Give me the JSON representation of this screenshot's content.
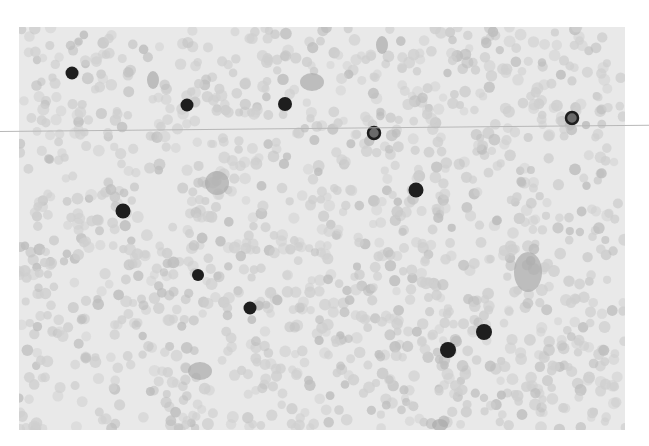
{
  "image": {
    "description": "Grayscale micrograph of a blood smear: dense field of pale red blood cells with scattered dark-stained nucleated cells",
    "colors": {
      "background": "#ffffff",
      "field": "#e9e9e9",
      "rbc": "#cfcfcf",
      "rbc_dark": "#bdbdbd",
      "nucleus": "#1e1e1e",
      "scanline": "#b8b8b8"
    },
    "frame": {
      "x": 19,
      "y": 27,
      "width": 606,
      "height": 403
    },
    "dark_cells": [
      {
        "x": 72,
        "y": 73,
        "r": 6.5
      },
      {
        "x": 187,
        "y": 105,
        "r": 6.5
      },
      {
        "x": 285,
        "y": 104,
        "r": 7
      },
      {
        "x": 374,
        "y": 133,
        "r": 6,
        "ring": true
      },
      {
        "x": 572,
        "y": 118,
        "r": 6,
        "ring": true
      },
      {
        "x": 416,
        "y": 190,
        "r": 7.5
      },
      {
        "x": 123,
        "y": 211,
        "r": 7.5
      },
      {
        "x": 198,
        "y": 275,
        "r": 6
      },
      {
        "x": 250,
        "y": 308,
        "r": 6.5
      },
      {
        "x": 448,
        "y": 350,
        "r": 8
      },
      {
        "x": 484,
        "y": 332,
        "r": 8
      }
    ],
    "clumps": [
      {
        "x": 312,
        "y": 82,
        "rx": 12,
        "ry": 9
      },
      {
        "x": 153,
        "y": 80,
        "rx": 6,
        "ry": 9
      },
      {
        "x": 382,
        "y": 45,
        "rx": 6,
        "ry": 9
      },
      {
        "x": 217,
        "y": 183,
        "rx": 12,
        "ry": 12
      },
      {
        "x": 528,
        "y": 272,
        "rx": 14,
        "ry": 20
      },
      {
        "x": 200,
        "y": 371,
        "rx": 12,
        "ry": 9
      },
      {
        "x": 440,
        "y": 425,
        "rx": 8,
        "ry": 6
      }
    ]
  }
}
